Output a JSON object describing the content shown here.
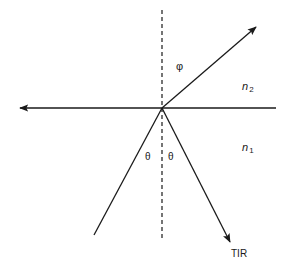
{
  "diagram": {
    "type": "ray-optics-total-internal-reflection",
    "labels": {
      "phi": "φ",
      "n2": "n",
      "n2_sub": "2",
      "n1": "n",
      "n1_sub": "1",
      "theta_left": "θ",
      "theta_right": "θ",
      "tir": "TIR"
    },
    "colors": {
      "line": "#1a1a1a",
      "background": "#ffffff"
    }
  }
}
